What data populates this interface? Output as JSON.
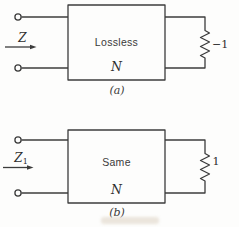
{
  "figure": {
    "background_color": "#fdfdfc",
    "line_color": "#3c3c3c",
    "text_color": "#2e2e2e",
    "diagrams": [
      {
        "id": "a",
        "box_label_line1": "Lossless",
        "box_label_line2": "N",
        "input_label": "Z",
        "input_label_sub": "",
        "resistor_label": "−1",
        "caption": "(a)"
      },
      {
        "id": "b",
        "box_label_line1": "Same",
        "box_label_line2": "N",
        "input_label": "Z",
        "input_label_sub": "1",
        "resistor_label": "1",
        "caption": "(b)"
      }
    ]
  }
}
